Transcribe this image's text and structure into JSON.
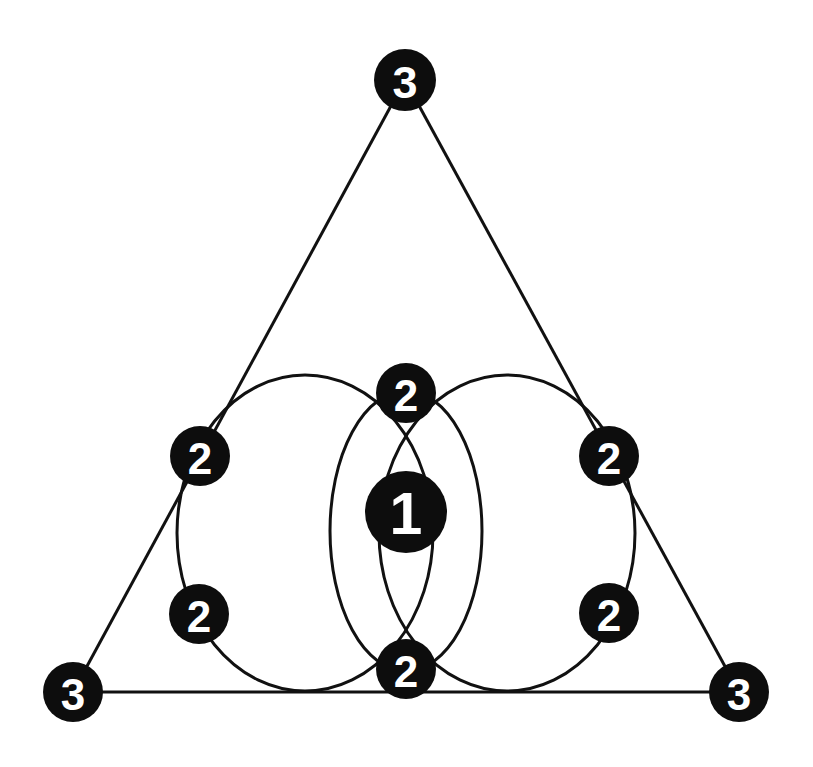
{
  "diagram": {
    "type": "node-graph",
    "background": "#ffffff",
    "stroke_color": "#111111",
    "node_fill": "#0d0d0d",
    "label_color": "#ffffff",
    "nodes": [
      {
        "id": "top-3",
        "label": "3",
        "cx": 405,
        "cy": 80,
        "r": 31
      },
      {
        "id": "left-upper-2",
        "label": "2",
        "cx": 200,
        "cy": 456,
        "r": 30
      },
      {
        "id": "top-center-2",
        "label": "2",
        "cx": 406,
        "cy": 393,
        "r": 30
      },
      {
        "id": "right-upper-2",
        "label": "2",
        "cx": 609,
        "cy": 456,
        "r": 30
      },
      {
        "id": "center-1",
        "label": "1",
        "cx": 406,
        "cy": 512,
        "r": 41
      },
      {
        "id": "left-lower-2",
        "label": "2",
        "cx": 199,
        "cy": 614,
        "r": 30
      },
      {
        "id": "right-lower-2",
        "label": "2",
        "cx": 609,
        "cy": 613,
        "r": 30
      },
      {
        "id": "bottom-center-2",
        "label": "2",
        "cx": 406,
        "cy": 669,
        "r": 30
      },
      {
        "id": "bottom-left-3",
        "label": "3",
        "cx": 73,
        "cy": 692,
        "r": 30
      },
      {
        "id": "bottom-right-3",
        "label": "3",
        "cx": 739,
        "cy": 692,
        "r": 30
      }
    ],
    "lines": [
      {
        "id": "triangle-left-edge",
        "x1": 405,
        "y1": 80,
        "x2": 73,
        "y2": 692
      },
      {
        "id": "triangle-right-edge",
        "x1": 405,
        "y1": 80,
        "x2": 739,
        "y2": 692
      },
      {
        "id": "triangle-base",
        "x1": 73,
        "y1": 692,
        "x2": 739,
        "y2": 692
      }
    ],
    "ellipses": [
      {
        "id": "left-circle",
        "cx": 305,
        "cy": 533,
        "rx": 128,
        "ry": 158
      },
      {
        "id": "right-circle",
        "cx": 507,
        "cy": 533,
        "rx": 128,
        "ry": 158
      },
      {
        "id": "inner-ellipse",
        "cx": 406,
        "cy": 531,
        "rx": 76,
        "ry": 140
      }
    ]
  }
}
